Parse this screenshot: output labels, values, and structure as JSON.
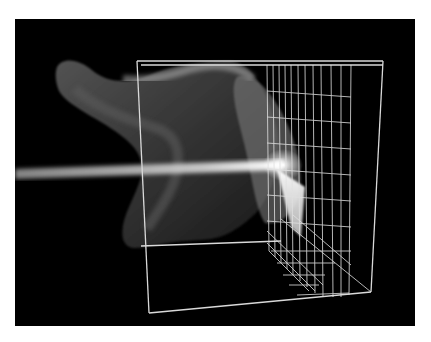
{
  "figure": {
    "background_color": "#000000",
    "frame_color": "#d9d9d9",
    "beam_color": "#f2f2f2",
    "volume_color": "#9a9a9a",
    "caption": ""
  }
}
